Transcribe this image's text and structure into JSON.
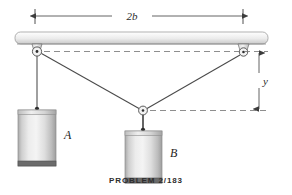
{
  "figure": {
    "caption": "PROBLEM 2/183",
    "dimensions": {
      "span_label": "2b",
      "height_label": "y"
    },
    "bodies": [
      {
        "id": "A",
        "label": "A"
      },
      {
        "id": "B",
        "label": "B"
      }
    ],
    "colors": {
      "line": "#4a4a4a",
      "dashed": "#6e6e6e",
      "beam_light": "#fbfbfb",
      "beam_mid": "#e2e2e2",
      "beam_dark": "#b9b9b9",
      "block_light": "#f2f2f2",
      "block_mid": "#cfcfcf",
      "block_dark": "#9a9a9a",
      "text": "#2b2b2b"
    }
  }
}
